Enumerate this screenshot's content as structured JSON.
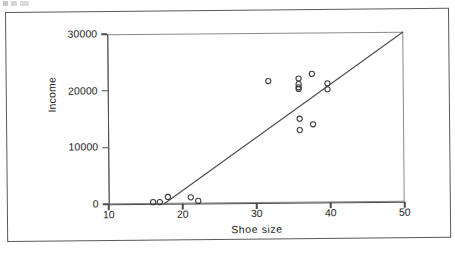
{
  "figure": {
    "frame_color": "#5a5a5a",
    "axis_color": "#4a4a4a",
    "marker_color": "#3a3a3a"
  },
  "axes": {
    "x_title": "Shoe  size",
    "y_title": "Income",
    "x_ticks": [
      "10",
      "20",
      "30",
      "40",
      "50"
    ],
    "y_ticks": [
      "0",
      "10000",
      "20000",
      "30000"
    ]
  },
  "chart_data": {
    "type": "scatter",
    "title": "",
    "xlabel": "Shoe size",
    "ylabel": "Income",
    "xlim": [
      10,
      50
    ],
    "ylim": [
      0,
      30000
    ],
    "xticks": [
      10,
      20,
      30,
      40,
      50
    ],
    "yticks": [
      0,
      10000,
      20000,
      30000
    ],
    "grid": false,
    "legend": "none",
    "marker": "open-circle",
    "points": [
      {
        "x": 16.0,
        "y": 300
      },
      {
        "x": 16.9,
        "y": 300
      },
      {
        "x": 18.0,
        "y": 1200
      },
      {
        "x": 21.1,
        "y": 1100
      },
      {
        "x": 22.1,
        "y": 450
      },
      {
        "x": 31.7,
        "y": 21500
      },
      {
        "x": 35.8,
        "y": 21900
      },
      {
        "x": 35.8,
        "y": 20900
      },
      {
        "x": 35.8,
        "y": 20350
      },
      {
        "x": 35.8,
        "y": 20050
      },
      {
        "x": 37.6,
        "y": 22700
      },
      {
        "x": 39.7,
        "y": 21000
      },
      {
        "x": 39.7,
        "y": 19950
      },
      {
        "x": 35.9,
        "y": 14800
      },
      {
        "x": 35.9,
        "y": 12800
      },
      {
        "x": 37.7,
        "y": 13800
      }
    ],
    "fit_line": {
      "label": "regression line",
      "x_start": 17.5,
      "y_start": 0,
      "x_end": 50.0,
      "y_end": 30000
    }
  }
}
